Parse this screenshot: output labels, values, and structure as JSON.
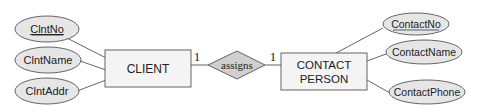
{
  "diagram": {
    "type": "ER diagram",
    "entities": [
      {
        "name": "CLIENT",
        "lines": [
          "CLIENT"
        ],
        "attributes": [
          {
            "label": "ClntNo",
            "key": true
          },
          {
            "label": "ClntName",
            "key": false
          },
          {
            "label": "ClntAddr",
            "key": false
          }
        ]
      },
      {
        "name": "CONTACT PERSON",
        "lines": [
          "CONTACT",
          "PERSON"
        ],
        "attributes": [
          {
            "label": "ContactNo",
            "key": true
          },
          {
            "label": "ContactName",
            "key": false
          },
          {
            "label": "ContactPhone",
            "key": false
          }
        ]
      }
    ],
    "relationship": {
      "label": "assigns",
      "cardinality_left": "1",
      "cardinality_right": "1"
    },
    "colors": {
      "shape_fill": "#f4f4f4",
      "attr_fill": "#e6e6e6",
      "diamond_fill": "#cfcfcf",
      "stroke": "#555555"
    }
  }
}
